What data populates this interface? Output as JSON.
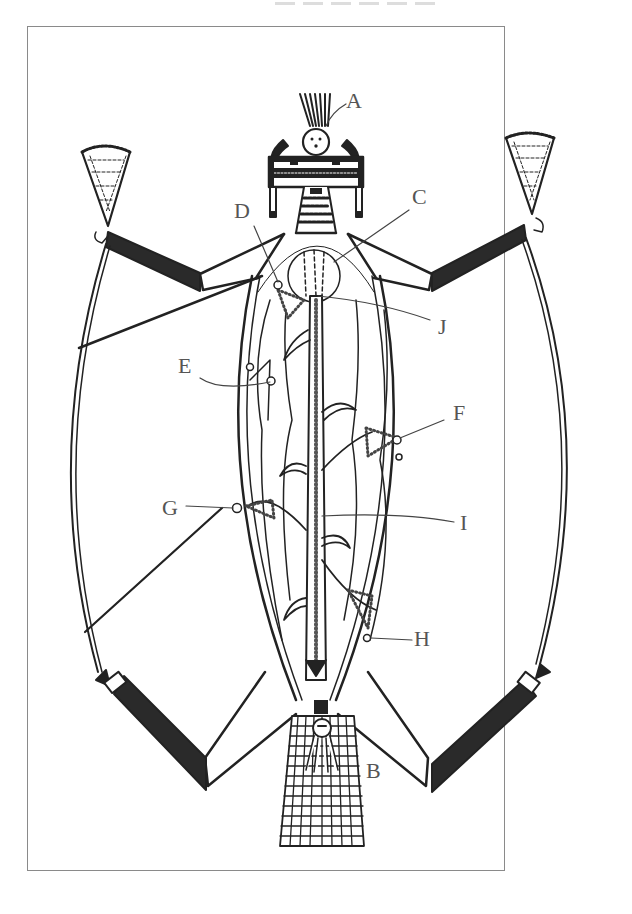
{
  "figure": {
    "colors": {
      "ink": "#222222",
      "fill_dark": "#2a2a2a",
      "label": "#555555",
      "frame": "#8a8a8a"
    }
  },
  "labels": {
    "A": "A",
    "B": "B",
    "C": "C",
    "D": "D",
    "E": "E",
    "F": "F",
    "G": "G",
    "H": "H",
    "I": "I",
    "J": "J"
  }
}
